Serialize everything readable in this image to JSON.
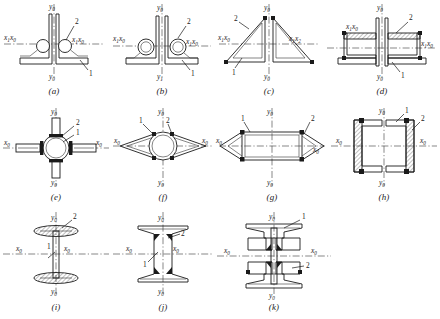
{
  "figure": {
    "type": "engineering-cross-section-plate",
    "rows": [
      4,
      4,
      3
    ],
    "axis_labels": {
      "y0": "y",
      "y0_sub": "0",
      "y1": "y",
      "y1_sub": "1",
      "x0": "x",
      "x0_sub": "0",
      "x1": "x",
      "x1_sub": "1",
      "x2": "x",
      "x2_sub": "2"
    },
    "callout_numbers": [
      "1",
      "2"
    ],
    "colors": {
      "line": "#1a1a1a",
      "centerline": "#555555",
      "weld": "#1a1a1a",
      "background": "#ffffff"
    }
  },
  "panels": [
    {
      "id": "a",
      "caption": "(a)",
      "description": "back-to-back angle sections with fillet weld beads",
      "axis_top": {
        "name": "y",
        "sub": "0"
      },
      "axis_bottom": {
        "name": "y",
        "sub": "0"
      },
      "axis_left": {
        "name": "x",
        "sub": "1",
        "name2": "x",
        "sub2": "0"
      },
      "axis_right": {
        "name": "x",
        "sub": "1",
        "name2": "x",
        "sub2": "0"
      },
      "callouts": [
        "2",
        "1"
      ]
    },
    {
      "id": "b",
      "caption": "(b)",
      "description": "angle sections with circular bar in corner, weld beads",
      "axis_top": {
        "name": "y",
        "sub": "0"
      },
      "axis_bottom": {
        "name": "y",
        "sub": "1"
      },
      "axis_left": {
        "name": "x",
        "sub": "1",
        "name2": "x",
        "sub2": "0"
      },
      "axis_right": {
        "name": "x",
        "sub": "1",
        "name2": "x",
        "sub2": "0"
      },
      "callouts": [
        "2",
        "1"
      ]
    },
    {
      "id": "c",
      "caption": "(c)",
      "description": "triangular lattice sections mirrored about vertical axis",
      "axis_top": {
        "name": "y",
        "sub": "0"
      },
      "axis_bottom": {
        "name": "y",
        "sub": "0"
      },
      "axis_left": {
        "name": "x",
        "sub": "1",
        "name2": "x",
        "sub2": "0"
      },
      "axis_right": {
        "name": "x",
        "sub": "1",
        "name2": "x",
        "sub2": "2"
      },
      "callouts": [
        "2",
        "1"
      ]
    },
    {
      "id": "d",
      "caption": "(d)",
      "description": "channel sections back-to-back with hatched webs",
      "axis_top": {
        "name": "y",
        "sub": "0"
      },
      "axis_bottom": {
        "name": "y",
        "sub": "0"
      },
      "axis_left": {
        "name": "x",
        "sub": "1",
        "name2": "x",
        "sub2": "0"
      },
      "axis_right": {
        "name": "x",
        "sub": "1",
        "name2": "x",
        "sub2": "0"
      },
      "callouts": [
        "2",
        "1"
      ]
    },
    {
      "id": "e",
      "caption": "(e)",
      "description": "circular tube with four radial plate arms",
      "axis_top": {
        "name": "y",
        "sub": "0"
      },
      "axis_bottom": {
        "name": "y",
        "sub": "0"
      },
      "axis_left": {
        "name": "x",
        "sub": "0"
      },
      "axis_right": {
        "name": "x",
        "sub": "0"
      },
      "callouts": [
        "2",
        "1"
      ]
    },
    {
      "id": "f",
      "caption": "(f)",
      "description": "circular tube with lens shaped side fairings",
      "axis_top": {
        "name": "y",
        "sub": "0"
      },
      "axis_bottom": {
        "name": "y",
        "sub": "0"
      },
      "axis_left": {
        "name": "x",
        "sub": "0"
      },
      "axis_right": {
        "name": "x",
        "sub": "0"
      },
      "callouts": [
        "1",
        "2"
      ]
    },
    {
      "id": "g",
      "caption": "(g)",
      "description": "rectangular box section with triangular side extensions",
      "axis_top": {
        "name": "y",
        "sub": "0"
      },
      "axis_bottom": {
        "name": "y",
        "sub": "0"
      },
      "axis_left": {
        "name": "x",
        "sub": "0"
      },
      "axis_right": {
        "name": "x",
        "sub": "0"
      },
      "callouts": [
        "1",
        "2"
      ]
    },
    {
      "id": "h",
      "caption": "(h)",
      "description": "paired hatched channel sections facing each other",
      "axis_top": {
        "name": "y",
        "sub": "0"
      },
      "axis_bottom": {
        "name": "y",
        "sub": "0"
      },
      "axis_left": {
        "name": "x",
        "sub": "0"
      },
      "axis_right": {
        "name": "x",
        "sub": "0"
      },
      "callouts": [
        "1",
        "2"
      ]
    },
    {
      "id": "i",
      "caption": "(i)",
      "description": "I-section with oval hatched flanges",
      "axis_top": {
        "name": "y",
        "sub": "0"
      },
      "axis_bottom": {
        "name": "y",
        "sub": "0"
      },
      "axis_left": {
        "name": "x",
        "sub": "0"
      },
      "axis_right": {
        "name": "x",
        "sub": "0"
      },
      "callouts": [
        "2",
        "1"
      ]
    },
    {
      "id": "j",
      "caption": "(j)",
      "description": "I-beam with tapered flanges and filleted web junctions",
      "axis_top": {
        "name": "y",
        "sub": "0"
      },
      "axis_bottom": {
        "name": "y",
        "sub": "0"
      },
      "axis_left": {
        "name": "x",
        "sub": "0"
      },
      "axis_right": {
        "name": "x",
        "sub": "0"
      },
      "callouts": [
        "2",
        "1"
      ]
    },
    {
      "id": "k",
      "caption": "(k)",
      "description": "built-up I-section with boxed flange cells and welds",
      "axis_top": {
        "name": "y",
        "sub": "0"
      },
      "axis_bottom": {
        "name": "y",
        "sub": "0"
      },
      "axis_left": {
        "name": "x",
        "sub": "0"
      },
      "axis_right": {
        "name": "x",
        "sub": "0"
      },
      "callouts": [
        "1",
        "2"
      ]
    }
  ]
}
